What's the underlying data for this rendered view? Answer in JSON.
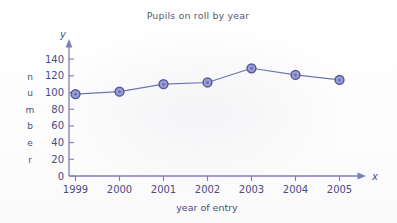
{
  "chart_data": {
    "type": "line",
    "title": "Pupils on roll by year",
    "xlabel": "year of entry",
    "ylabel": "number",
    "x_axis_letter": "x",
    "y_axis_letter": "y",
    "categories": [
      "1999",
      "2000",
      "2001",
      "2002",
      "2003",
      "2004",
      "2005"
    ],
    "values": [
      98,
      101,
      110,
      112,
      129,
      121,
      115
    ],
    "series": [
      {
        "name": "Pupils on roll",
        "values": [
          98,
          101,
          110,
          112,
          129,
          121,
          115
        ]
      }
    ],
    "ylim": [
      0,
      150
    ],
    "y_ticks": [
      0,
      20,
      40,
      60,
      80,
      100,
      120,
      140
    ],
    "y_tick_labels": [
      "0",
      "20",
      "40",
      "60",
      "80",
      "100",
      "120",
      "140"
    ],
    "xlim_categories": [
      "1999",
      "2005"
    ],
    "grid": false,
    "legend": false,
    "legend_position": "none",
    "marker": "circle",
    "line_color": "#6f74b4",
    "marker_fill": "#9a9ed2",
    "marker_edge": "#545a9e",
    "axis_color": "#7b7fb8",
    "text_color": "#4a4d80",
    "title_color": "#595b6b",
    "background": "#ffffff",
    "ylabel_letters": [
      "n",
      "u",
      "m",
      "b",
      "e",
      "r"
    ]
  }
}
